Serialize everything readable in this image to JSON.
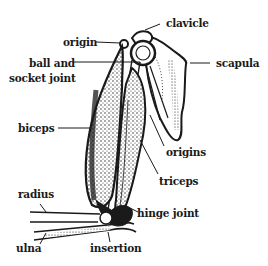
{
  "diagram": {
    "ink_color": "#1a1a1a",
    "background": "#ffffff",
    "labels": [
      {
        "id": "origin",
        "text": "origin"
      },
      {
        "id": "clavicle",
        "text": "clavicle"
      },
      {
        "id": "ball_socket_1",
        "text": "ball and"
      },
      {
        "id": "ball_socket_2",
        "text": "socket joint"
      },
      {
        "id": "scapula",
        "text": "scapula"
      },
      {
        "id": "biceps",
        "text": "biceps"
      },
      {
        "id": "origins",
        "text": "origins"
      },
      {
        "id": "triceps",
        "text": "triceps"
      },
      {
        "id": "radius",
        "text": "radius"
      },
      {
        "id": "hinge_joint",
        "text": "hinge joint"
      },
      {
        "id": "ulna",
        "text": "ulna"
      },
      {
        "id": "insertion",
        "text": "insertion"
      }
    ]
  }
}
